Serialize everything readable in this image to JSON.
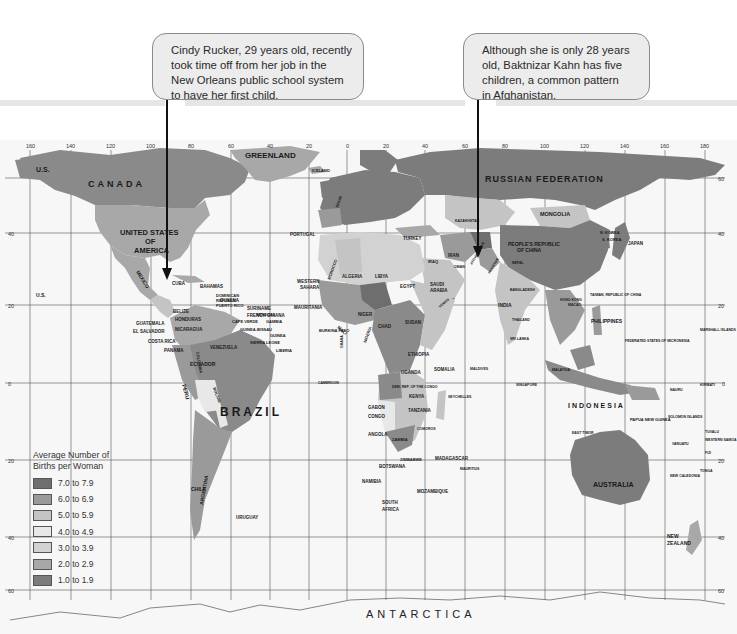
{
  "callouts": {
    "left": {
      "lines": [
        "Cindy Rucker, 29 years old, recently",
        "took time off from her job in the",
        "New Orleans public school system",
        "to have her first child."
      ],
      "points_to": "United States of America (New Orleans)"
    },
    "right": {
      "lines": [
        "Although she is only 28 years",
        "old, Baktnizar Kahn has five",
        "children, a common pattern",
        "in Afghanistan."
      ],
      "points_to": "Afghanistan"
    }
  },
  "legend": {
    "title_line1": "Average Number of",
    "title_line2": "Births per Woman",
    "items": [
      {
        "label": "7.0 to 7.9",
        "color": "#6e6e6e"
      },
      {
        "label": "6.0 to 6.9",
        "color": "#9a9a9a"
      },
      {
        "label": "5.0 to 5.9",
        "color": "#c4c4c4"
      },
      {
        "label": "4.0 to 4.9",
        "color": "#e8e8e8"
      },
      {
        "label": "3.0 to 3.9",
        "color": "#d2d2d2"
      },
      {
        "label": "2.0 to 2.9",
        "color": "#a8a8a8"
      },
      {
        "label": "1.0 to 1.9",
        "color": "#7c7c7c"
      }
    ]
  },
  "map": {
    "longitude_ticks": [
      "160",
      "140",
      "120",
      "100",
      "80",
      "60",
      "40",
      "20",
      "0",
      "20",
      "40",
      "60",
      "80",
      "100",
      "120",
      "140",
      "160",
      "180"
    ],
    "latitude_ticks_left": [
      "40",
      "20",
      "0",
      "20",
      "40",
      "60"
    ],
    "latitude_ticks_right": [
      "60",
      "40",
      "20",
      "0",
      "20",
      "40",
      "60"
    ],
    "bottom_label": "ANTARCTICA",
    "large_labels": {
      "canada": "CANADA",
      "greenland": "GREENLAND",
      "russia": "RUSSIAN FEDERATION",
      "usa_1": "UNITED STATES",
      "usa_2": "OF",
      "usa_3": "AMERICA",
      "brazil": "BRAZIL",
      "australia": "AUSTRALIA",
      "indonesia": "INDONESIA",
      "us_alaska": "U.S.",
      "us_hawaii": "U.S.",
      "mexico": "MEXICO",
      "china_1": "PEOPLE'S REPUBLIC",
      "china_2": "OF CHINA",
      "mongolia": "MONGOLIA",
      "india": "INDIA",
      "japan": "JAPAN",
      "n_korea": "N. KOREA",
      "s_korea": "S. KOREA",
      "philippines": "PHILIPPINES",
      "peru": "PERU",
      "chile": "CHILE",
      "argentina": "ARGENTINA",
      "bolivia": "BOLIVIA",
      "uruguay": "URUGUAY",
      "ecuador": "ECUADOR",
      "colombia": "COLOMBIA",
      "venezuela": "VENEZUELA",
      "guyana": "GUYANA",
      "suriname": "SURINAME",
      "french_guiana": "FRENCH GUIANA",
      "cuba": "CUBA",
      "bahamas": "BAHAMAS",
      "dominican_1": "DOMINICAN",
      "dominican_2": "REPUBLIC",
      "puerto_rico": "PUERTO RICO",
      "belize": "BELIZE",
      "honduras": "HONDURAS",
      "guatemala": "GUATEMALA",
      "el_salvador": "EL SALVADOR",
      "nicaragua": "NICARAGUA",
      "costa_rica": "COSTA RICA",
      "panama": "PANAMA",
      "iceland": "ICELAND",
      "portugal": "PORTUGAL",
      "spain": "SPAIN",
      "turkey": "TURKEY",
      "iran": "IRAN",
      "iraq": "IRAQ",
      "afghanistan": "AFGHANISTAN",
      "pakistan": "PAKISTAN",
      "kazakhstan": "KAZAKHSTAN",
      "saudi_1": "SAUDI",
      "saudi_2": "ARABIA",
      "yemen": "YEMEN",
      "oman": "OMAN",
      "egypt": "EGYPT",
      "libya": "LIBYA",
      "algeria": "ALGERIA",
      "morocco": "MOROCCO",
      "western_sahara_1": "WESTERN",
      "western_sahara_2": "SAHARA",
      "mauritania": "MAURITANIA",
      "mali": "MALI",
      "niger": "NIGER",
      "chad": "CHAD",
      "sudan": "SUDAN",
      "ethiopia": "ETHIOPIA",
      "somalia": "SOMALIA",
      "nigeria": "NIGERIA",
      "senegal": "SENEGAL",
      "gambia": "GAMBIA",
      "guinea_bissau": "GUINEA-BISSAU",
      "guinea": "GUINEA",
      "sierra_leone": "SIERRA LEONE",
      "liberia": "LIBERIA",
      "cape_verde": "CAPE VERDE",
      "burkina_faso": "BURKINA FASO",
      "ghana": "GHANA",
      "cameroon": "CAMEROON",
      "gabon": "GABON",
      "congo": "CONGO",
      "dem_rep_congo": "DEM. REP. OF THE CONGO",
      "uganda": "UGANDA",
      "kenya": "KENYA",
      "tanzania": "TANZANIA",
      "angola": "ANGOLA",
      "zambia": "ZAMBIA",
      "zimbabwe": "ZIMBABWE",
      "botswana": "BOTSWANA",
      "namibia": "NAMIBIA",
      "south_africa_1": "SOUTH",
      "south_africa_2": "AFRICA",
      "mozambique": "MOZAMBIQUE",
      "madagascar": "MADAGASCAR",
      "mauritius": "MAURITIUS",
      "comoros": "COMOROS",
      "seychelles": "SEYCHELLES",
      "maldives": "MALDIVES",
      "sri_lanka": "SRI LANKA",
      "bangladesh": "BANGLADESH",
      "nepal": "NEPAL",
      "thailand": "THAILAND",
      "malaysia": "MALAYSIA",
      "singapore": "SINGAPORE",
      "papua_new_guinea": "PAPUA NEW GUINEA",
      "new_zealand_1": "NEW",
      "new_zealand_2": "ZEALAND",
      "new_caledonia": "NEW CALEDONIA",
      "solomon": "SOLOMON ISLANDS",
      "micronesia": "FEDERATED STATES OF MICRONESIA",
      "marshall": "MARSHALL ISLANDS",
      "nauru": "NAURU",
      "kiribati": "KIRIBATI",
      "tuvalu": "TUVALU",
      "vanuatu": "VANUATU",
      "fiji": "FIJI",
      "tonga": "TONGA",
      "western_samoa": "WESTERN SAMOA",
      "east_timor": "EAST TIMOR",
      "taiwan": "TAIWAN, REPUBLIC OF CHINA",
      "hong_kong": "HONG KONG",
      "macao": "MACAO"
    }
  }
}
